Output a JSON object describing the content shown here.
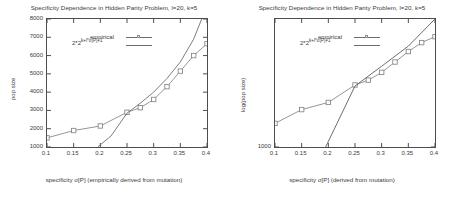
{
  "figure": {
    "panels": [
      {
        "id": "left",
        "title": "Specificity Dependence in Hidden Parity Problem, l=20, k=5",
        "xlabel": "specificity σ[P] (empirically derived from mutation)",
        "ylabel": "pop size",
        "legend": {
          "empirical_label": "empirical",
          "formula_base": "2*2",
          "formula_exp": "k+l*σ[P]+1"
        },
        "xticks": [
          "0.1",
          "0.15",
          "0.2",
          "0.25",
          "0.3",
          "0.35",
          "0.4"
        ],
        "yticks": [
          "1000",
          "2000",
          "3000",
          "4000",
          "5000",
          "6000",
          "7000",
          "8000"
        ]
      },
      {
        "id": "right",
        "title": "Specificity Dependence in Hidden Parity Problem, l=20, k=5",
        "xlabel": "specificity σ[P] (derived from mutation)",
        "ylabel": "log(pop size)",
        "legend": {
          "empirical_label": "empirical",
          "formula_base": "2*2",
          "formula_exp": "k+l*σ[P]+1"
        },
        "xticks": [
          "0.1",
          "0.15",
          "0.2",
          "0.25",
          "0.3",
          "0.35",
          "0.4"
        ],
        "yticks": [
          "1000"
        ]
      }
    ]
  },
  "chart_data": [
    {
      "type": "scatter",
      "panel": "left",
      "title": "Specificity Dependence in Hidden Parity Problem, l=20, k=5",
      "xlabel": "specificity σ[P] (empirically derived from mutation)",
      "ylabel": "pop size",
      "xlim": [
        0.1,
        0.4
      ],
      "ylim": [
        1000,
        8000
      ],
      "yscale": "linear",
      "grid": false,
      "legend_position": "upper-left-inside",
      "series": [
        {
          "name": "empirical",
          "marker": "open-square",
          "line": true,
          "color": "#8a8a8a",
          "x": [
            0.1,
            0.15,
            0.2,
            0.25,
            0.275,
            0.3,
            0.325,
            0.35,
            0.375,
            0.4
          ],
          "y": [
            1500,
            1900,
            2150,
            2900,
            3150,
            3600,
            4300,
            5150,
            6000,
            6650
          ]
        },
        {
          "name": "2*2^(k+l*σ[P]+1)",
          "marker": "none",
          "line": true,
          "color": "#6e6e6e",
          "x": [
            0.195,
            0.22,
            0.25,
            0.275,
            0.3,
            0.325,
            0.35,
            0.375,
            0.39
          ],
          "y": [
            1000,
            1600,
            2850,
            3400,
            4000,
            4750,
            5650,
            6900,
            8000
          ]
        }
      ]
    },
    {
      "type": "scatter",
      "panel": "right",
      "title": "Specificity Dependence in Hidden Parity Problem, l=20, k=5",
      "xlabel": "specificity σ[P] (derived from mutation)",
      "ylabel": "log(pop size)",
      "xlim": [
        0.1,
        0.4
      ],
      "ylim": [
        1000,
        9000
      ],
      "yscale": "log",
      "grid": false,
      "legend_position": "upper-left-inside",
      "series": [
        {
          "name": "empirical",
          "marker": "open-square",
          "line": true,
          "color": "#8a8a8a",
          "x": [
            0.1,
            0.15,
            0.2,
            0.25,
            0.275,
            0.3,
            0.325,
            0.35,
            0.375,
            0.4
          ],
          "y": [
            1500,
            1900,
            2150,
            2900,
            3150,
            3600,
            4300,
            5150,
            6000,
            6650
          ]
        },
        {
          "name": "2*2^(k+l*σ[P]+1)",
          "marker": "none",
          "line": true,
          "color": "#5c5c5c",
          "x": [
            0.195,
            0.25,
            0.3,
            0.35,
            0.4
          ],
          "y": [
            1000,
            2850,
            4000,
            5650,
            9000
          ]
        }
      ]
    }
  ]
}
